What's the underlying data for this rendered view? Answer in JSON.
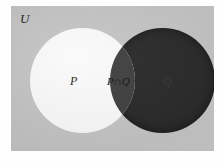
{
  "figure": {
    "type": "venn-diagram",
    "universal_set_label": "U",
    "sets": [
      {
        "key": "p",
        "label": "P",
        "fill_color": "#fdfdfd",
        "description": "left circle, white fill"
      },
      {
        "key": "q",
        "label": "Q",
        "fill_color": "#262626",
        "description": "right circle, dark fill"
      },
      {
        "key": "pq",
        "label": "P∩Q",
        "fill_color": "#3c3c3c",
        "description": "lens shaped overlap region, shaded"
      }
    ],
    "background_color": "#c6c6c6",
    "page_color": "#fefefe"
  }
}
